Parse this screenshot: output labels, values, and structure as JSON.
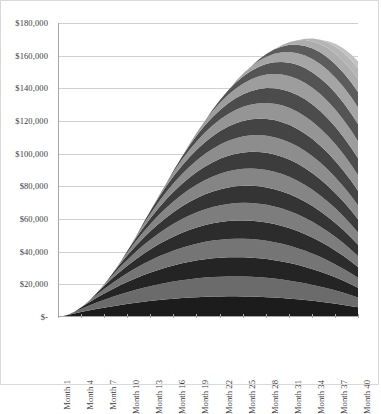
{
  "chart_data": {
    "type": "area",
    "stacked": true,
    "title": "",
    "xlabel": "",
    "ylabel": "",
    "grid": true,
    "legend": "none",
    "ylim": [
      0,
      180000
    ],
    "y_ticks": [
      "$180,000",
      "$160,000",
      "$140,000",
      "$120,000",
      "$100,000",
      "$80,000",
      "$60,000",
      "$40,000",
      "$20,000",
      "$-"
    ],
    "y_tick_values": [
      180000,
      160000,
      140000,
      120000,
      100000,
      80000,
      60000,
      40000,
      20000,
      0
    ],
    "x_tick_labels": [
      "Month 1",
      "Month 4",
      "Month 7",
      "Month 10",
      "Month 13",
      "Month 16",
      "Month 19",
      "Month 22",
      "Month 25",
      "Month 28",
      "Month 31",
      "Month 34",
      "Month 37",
      "Month 40"
    ],
    "x_tick_values": [
      1,
      4,
      7,
      10,
      13,
      16,
      19,
      22,
      25,
      28,
      31,
      34,
      37,
      40
    ],
    "x_range": [
      1,
      40
    ],
    "categories": [
      "Month 1",
      "Month 2",
      "Month 3",
      "Month 4",
      "Month 5",
      "Month 6",
      "Month 7",
      "Month 8",
      "Month 9",
      "Month 10",
      "Month 11",
      "Month 12",
      "Month 13",
      "Month 14",
      "Month 15",
      "Month 16",
      "Month 17",
      "Month 18",
      "Month 19",
      "Month 20",
      "Month 21",
      "Month 22",
      "Month 23",
      "Month 24",
      "Month 25",
      "Month 26",
      "Month 27",
      "Month 28",
      "Month 29",
      "Month 30",
      "Month 31",
      "Month 32",
      "Month 33",
      "Month 34",
      "Month 35",
      "Month 36",
      "Month 37",
      "Month 38",
      "Month 39",
      "Month 40"
    ],
    "total": [
      0,
      4200,
      8300,
      12300,
      16200,
      20000,
      23700,
      27300,
      30800,
      34200,
      37500,
      40700,
      43900,
      47000,
      50100,
      53200,
      56300,
      59400,
      62500,
      65600,
      68700,
      71800,
      75000,
      78300,
      81700,
      85200,
      88800,
      92500,
      96300,
      100200,
      104200,
      108300,
      112500,
      116900,
      121400,
      126100,
      131000,
      136100,
      141400,
      147000
    ],
    "series": [
      {
        "name": "Cohort 1",
        "color": "#1c1c1c",
        "start_month": 1,
        "values": [
          0,
          1100,
          2150,
          3150,
          4100,
          5000,
          5850,
          6650,
          7400,
          8100,
          8750,
          9350,
          9900,
          10400,
          10850,
          11250,
          11600,
          11900,
          12150,
          12350,
          12500,
          12600,
          12650,
          12650,
          12600,
          12500,
          12350,
          12150,
          11900,
          11600,
          11250,
          10850,
          10400,
          9900,
          9350,
          8750,
          8100,
          7400,
          6650,
          5850
        ]
      },
      {
        "name": "Cohort 2",
        "color": "#6b6b6b",
        "start_month": 2,
        "values": [
          0,
          0,
          1080,
          2110,
          3090,
          4020,
          4900,
          5730,
          6510,
          7240,
          7920,
          8550,
          9130,
          9660,
          10140,
          10570,
          10950,
          11280,
          11560,
          11790,
          11970,
          12100,
          12180,
          12210,
          12190,
          12120,
          12000,
          11830,
          11610,
          11340,
          11020,
          10650,
          10230,
          9760,
          9240,
          8670,
          8050,
          7380,
          6660,
          5890
        ]
      },
      {
        "name": "Cohort 3",
        "color": "#242424",
        "start_month": 3,
        "values": [
          0,
          0,
          0,
          1060,
          2070,
          3030,
          3940,
          4800,
          5610,
          6370,
          7080,
          7740,
          8350,
          8910,
          9420,
          9880,
          10290,
          10650,
          10960,
          11220,
          11430,
          11590,
          11700,
          11760,
          11770,
          11730,
          11640,
          11500,
          11310,
          11070,
          10780,
          10440,
          10050,
          9610,
          9120,
          8580,
          7990,
          7350,
          6660,
          5920
        ]
      },
      {
        "name": "Cohort 4",
        "color": "#757575",
        "start_month": 4,
        "values": [
          0,
          0,
          0,
          0,
          1040,
          2030,
          2970,
          3860,
          4700,
          5490,
          6230,
          6920,
          7560,
          8150,
          8690,
          9180,
          9620,
          10010,
          10350,
          10640,
          10880,
          11070,
          11210,
          11300,
          11340,
          11330,
          11270,
          11160,
          11000,
          10790,
          10530,
          10220,
          9860,
          9450,
          8990,
          8480,
          7920,
          7310,
          6650,
          5940
        ]
      },
      {
        "name": "Cohort 5",
        "color": "#2c2c2c",
        "start_month": 5,
        "values": [
          0,
          0,
          0,
          0,
          0,
          1020,
          1990,
          2920,
          3800,
          4640,
          5430,
          6170,
          6860,
          7500,
          8090,
          8630,
          9120,
          9560,
          9950,
          10290,
          10580,
          10820,
          11010,
          11150,
          11240,
          11280,
          11270,
          11210,
          11100,
          10940,
          10730,
          10470,
          10160,
          9800,
          9390,
          8930,
          8420,
          7860,
          7250,
          6590
        ]
      },
      {
        "name": "Cohort 6",
        "color": "#7d7d7d",
        "start_month": 6,
        "values": [
          0,
          0,
          0,
          0,
          0,
          0,
          1000,
          1950,
          2860,
          3720,
          4540,
          5310,
          6030,
          6700,
          7320,
          7890,
          8410,
          8880,
          9300,
          9670,
          9990,
          10260,
          10480,
          10650,
          10770,
          10840,
          10860,
          10830,
          10750,
          10620,
          10440,
          10210,
          9930,
          9600,
          9220,
          8790,
          8310,
          7780,
          7200,
          6570
        ]
      },
      {
        "name": "Cohort 7",
        "color": "#343434",
        "start_month": 7,
        "values": [
          0,
          0,
          0,
          0,
          0,
          0,
          0,
          990,
          1930,
          2830,
          3690,
          4500,
          5260,
          5970,
          6630,
          7240,
          7800,
          8310,
          8770,
          9180,
          9540,
          9850,
          10110,
          10320,
          10480,
          10590,
          10650,
          10660,
          10620,
          10530,
          10390,
          10200,
          9960,
          9670,
          9330,
          8940,
          8500,
          8010,
          7470,
          6880
        ]
      },
      {
        "name": "Cohort 8",
        "color": "#858585",
        "start_month": 8,
        "values": [
          0,
          0,
          0,
          0,
          0,
          0,
          0,
          0,
          980,
          1920,
          2820,
          3670,
          4480,
          5240,
          5950,
          6610,
          7220,
          7780,
          8290,
          8750,
          9160,
          9520,
          9830,
          10090,
          10300,
          10460,
          10570,
          10630,
          10640,
          10600,
          10510,
          10370,
          10180,
          9940,
          9650,
          9310,
          8920,
          8480,
          7990,
          7450
        ]
      },
      {
        "name": "Cohort 9",
        "color": "#3c3c3c",
        "start_month": 9,
        "values": [
          0,
          0,
          0,
          0,
          0,
          0,
          0,
          0,
          0,
          970,
          1910,
          2810,
          3670,
          4480,
          5240,
          5950,
          6610,
          7220,
          7780,
          8290,
          8750,
          9160,
          9520,
          9830,
          10090,
          10300,
          10460,
          10570,
          10630,
          10640,
          10600,
          10510,
          10370,
          10180,
          9940,
          9650,
          9310,
          8920,
          8480,
          7990
        ]
      },
      {
        "name": "Cohort 10",
        "color": "#8d8d8d",
        "start_month": 10,
        "values": [
          0,
          0,
          0,
          0,
          0,
          0,
          0,
          0,
          0,
          0,
          960,
          1900,
          2800,
          3660,
          4470,
          5230,
          5940,
          6600,
          7210,
          7770,
          8280,
          8740,
          9150,
          9510,
          9820,
          10080,
          10290,
          10450,
          10560,
          10620,
          10630,
          10590,
          10500,
          10360,
          10170,
          9930,
          9640,
          9300,
          8910,
          8470
        ]
      },
      {
        "name": "Cohort 11",
        "color": "#444444",
        "start_month": 12,
        "values": [
          0,
          0,
          0,
          0,
          0,
          0,
          0,
          0,
          0,
          0,
          0,
          950,
          1890,
          2790,
          3650,
          4460,
          5220,
          5930,
          6590,
          7200,
          7760,
          8270,
          8730,
          9140,
          9500,
          9810,
          10070,
          10280,
          10440,
          10550,
          10610,
          10620,
          10580,
          10490,
          10350,
          10160,
          9920,
          9630,
          9290,
          8900
        ]
      },
      {
        "name": "Cohort 12",
        "color": "#959595",
        "start_month": 14,
        "values": [
          0,
          0,
          0,
          0,
          0,
          0,
          0,
          0,
          0,
          0,
          0,
          0,
          0,
          940,
          1880,
          2780,
          3640,
          4450,
          5210,
          5920,
          6580,
          7190,
          7750,
          8260,
          8720,
          9130,
          9490,
          9800,
          10060,
          10270,
          10430,
          10540,
          10600,
          10610,
          10570,
          10480,
          10340,
          10150,
          9910,
          9620
        ]
      },
      {
        "name": "Cohort 13",
        "color": "#4c4c4c",
        "start_month": 16,
        "values": [
          0,
          0,
          0,
          0,
          0,
          0,
          0,
          0,
          0,
          0,
          0,
          0,
          0,
          0,
          0,
          930,
          1870,
          2770,
          3630,
          4440,
          5200,
          5910,
          6570,
          7180,
          7740,
          8250,
          8710,
          9120,
          9480,
          9790,
          10050,
          10260,
          10420,
          10530,
          10590,
          10600,
          10560,
          10470,
          10330,
          10140
        ]
      },
      {
        "name": "Cohort 14",
        "color": "#9d9d9d",
        "start_month": 18,
        "values": [
          0,
          0,
          0,
          0,
          0,
          0,
          0,
          0,
          0,
          0,
          0,
          0,
          0,
          0,
          0,
          0,
          0,
          920,
          1860,
          2760,
          3620,
          4430,
          5190,
          5900,
          6560,
          7170,
          7730,
          8240,
          8700,
          9110,
          9470,
          9780,
          10040,
          10250,
          10410,
          10520,
          10580,
          10590,
          10550,
          10460
        ]
      },
      {
        "name": "Cohort 15",
        "color": "#545454",
        "start_month": 21,
        "values": [
          0,
          0,
          0,
          0,
          0,
          0,
          0,
          0,
          0,
          0,
          0,
          0,
          0,
          0,
          0,
          0,
          0,
          0,
          0,
          0,
          910,
          1850,
          2750,
          3610,
          4420,
          5180,
          5890,
          6550,
          7160,
          7720,
          8230,
          8690,
          9100,
          9460,
          9770,
          10030,
          10240,
          10400,
          10510,
          10570
        ]
      },
      {
        "name": "Cohort 16",
        "color": "#a5a5a5",
        "start_month": 24,
        "values": [
          0,
          0,
          0,
          0,
          0,
          0,
          0,
          0,
          0,
          0,
          0,
          0,
          0,
          0,
          0,
          0,
          0,
          0,
          0,
          0,
          0,
          0,
          0,
          900,
          1840,
          2740,
          3600,
          4410,
          5170,
          5880,
          6540,
          7150,
          7710,
          8220,
          8680,
          9090,
          9450,
          9760,
          10020,
          10230
        ]
      },
      {
        "name": "Cohort 17",
        "color": "#5c5c5c",
        "start_month": 27,
        "values": [
          0,
          0,
          0,
          0,
          0,
          0,
          0,
          0,
          0,
          0,
          0,
          0,
          0,
          0,
          0,
          0,
          0,
          0,
          0,
          0,
          0,
          0,
          0,
          0,
          0,
          0,
          890,
          1830,
          2730,
          3590,
          4400,
          5160,
          5870,
          6530,
          7140,
          7700,
          8210,
          8670,
          9080,
          9440
        ]
      },
      {
        "name": "Cohort 18",
        "color": "#adadad",
        "start_month": 30,
        "values": [
          0,
          0,
          0,
          0,
          0,
          0,
          0,
          0,
          0,
          0,
          0,
          0,
          0,
          0,
          0,
          0,
          0,
          0,
          0,
          0,
          0,
          0,
          0,
          0,
          0,
          0,
          0,
          0,
          0,
          880,
          1820,
          2720,
          3580,
          4390,
          5150,
          5860,
          6520,
          7130,
          7690,
          8200
        ]
      },
      {
        "name": "Cohort 19",
        "color": "#b5b5b5",
        "start_month": 33,
        "values": [
          0,
          0,
          0,
          0,
          0,
          0,
          0,
          0,
          0,
          0,
          0,
          0,
          0,
          0,
          0,
          0,
          0,
          0,
          0,
          0,
          0,
          0,
          0,
          0,
          0,
          0,
          0,
          0,
          0,
          0,
          0,
          0,
          870,
          1810,
          2710,
          3570,
          4380,
          5140,
          5850,
          6510
        ]
      },
      {
        "name": "Cohort 20",
        "color": "#c2c2c2",
        "start_month": 36,
        "values": [
          0,
          0,
          0,
          0,
          0,
          0,
          0,
          0,
          0,
          0,
          0,
          0,
          0,
          0,
          0,
          0,
          0,
          0,
          0,
          0,
          0,
          0,
          0,
          0,
          0,
          0,
          0,
          0,
          0,
          0,
          0,
          0,
          0,
          0,
          0,
          860,
          1800,
          2700,
          3560,
          4370
        ]
      }
    ],
    "colors": {
      "gridline": "#d0d0d0",
      "axis": "#a6a6a6",
      "frame": "#d9d9d9",
      "tick_text": "#3a3a3a",
      "plot_background": "#ffffff"
    }
  }
}
